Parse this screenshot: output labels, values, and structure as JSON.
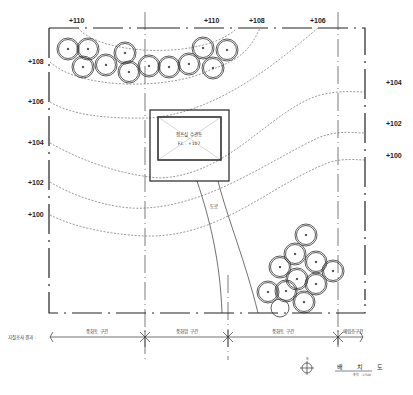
{
  "diagram": {
    "title": "배 치 도",
    "scale_note": "축척 : 1/500",
    "north_label": "북",
    "building": {
      "name": "펌프실 수관동",
      "floor_level": "F.L : +107"
    },
    "road_label": "도로",
    "contours": {
      "top": [
        "+110",
        "+110",
        "+108",
        "+106"
      ],
      "left": [
        "+108",
        "+106",
        "+104",
        "+102",
        "+100"
      ],
      "right": [
        "+104",
        "+102",
        "+100"
      ]
    },
    "geology": {
      "label": "지질조사 결과 :",
      "segments": [
        "풍화토 구간",
        "풍화암 구간",
        "풍화토 구간",
        "매립층구간"
      ]
    }
  }
}
